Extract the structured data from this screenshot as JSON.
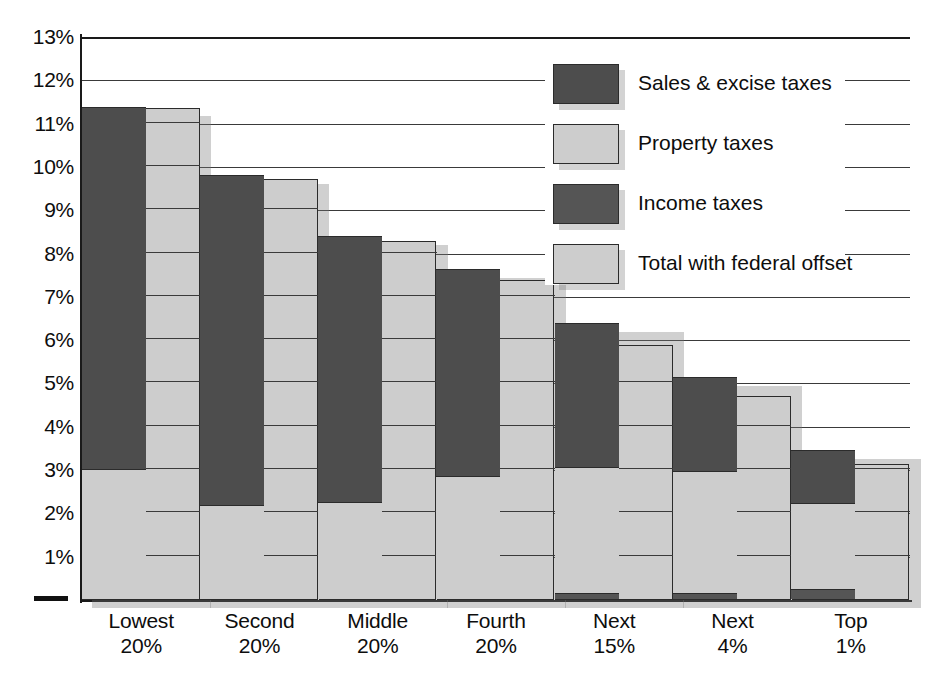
{
  "chart_data": {
    "type": "bar",
    "title": "",
    "subtitle": "",
    "xlabel": "",
    "ylabel": "",
    "ylim": [
      0,
      13
    ],
    "ytick_values": [
      13,
      12,
      11,
      10,
      9,
      8,
      7,
      6,
      5,
      4,
      3,
      2,
      1
    ],
    "ytick_labels": [
      "13%",
      "12%",
      "11%",
      "10%",
      "9%",
      "8%",
      "7%",
      "6%",
      "5%",
      "4%",
      "3%",
      "2%",
      "1%"
    ],
    "grid": true,
    "legend_position": "top-right",
    "categories": [
      "Lowest 20%",
      "Second 20%",
      "Middle 20%",
      "Fourth 20%",
      "Next 15%",
      "Next 4%",
      "Top 1%"
    ],
    "category_lines": [
      [
        "Lowest",
        "20%"
      ],
      [
        "Second",
        "20%"
      ],
      [
        "Middle",
        "20%"
      ],
      [
        "Fourth",
        "20%"
      ],
      [
        "Next",
        "15%"
      ],
      [
        "Next",
        "4%"
      ],
      [
        "Top",
        "1%"
      ]
    ],
    "legend": [
      {
        "label": "Sales & excise taxes",
        "color": "#4d4d4d",
        "key": "sales_excise"
      },
      {
        "label": "Property taxes",
        "color": "#cdcdcd",
        "key": "property"
      },
      {
        "label": "Income taxes",
        "color": "#555555",
        "key": "income"
      },
      {
        "label": "Total with federal offset",
        "color": "#cdcdcd",
        "key": "offset"
      }
    ],
    "series": [
      {
        "name": "Income taxes",
        "values": [
          0.0,
          0.0,
          0.0,
          0.0,
          0.15,
          0.15,
          0.22
        ]
      },
      {
        "name": "Property taxes",
        "values": [
          3.0,
          2.18,
          2.25,
          2.85,
          2.9,
          2.8,
          2.0
        ]
      },
      {
        "name": "Sales & excise taxes",
        "values": [
          8.35,
          7.6,
          6.13,
          4.78,
          3.33,
          2.17,
          1.23
        ]
      },
      {
        "name": "Total with federal offset",
        "values": [
          11.35,
          9.73,
          8.28,
          7.38,
          5.9,
          4.7,
          3.15
        ]
      }
    ],
    "totals": [
      11.35,
      9.78,
      8.38,
      7.63,
      6.38,
      5.12,
      3.45
    ],
    "offsets": [
      11.35,
      9.73,
      8.28,
      7.38,
      5.9,
      4.7,
      3.15
    ]
  },
  "colors": {
    "dark": "#4d4d4d",
    "light": "#cdcdcd",
    "income": "#555555",
    "outline": "#2b2b2b",
    "axis": "#1a1a1a",
    "background": "#ffffff"
  }
}
